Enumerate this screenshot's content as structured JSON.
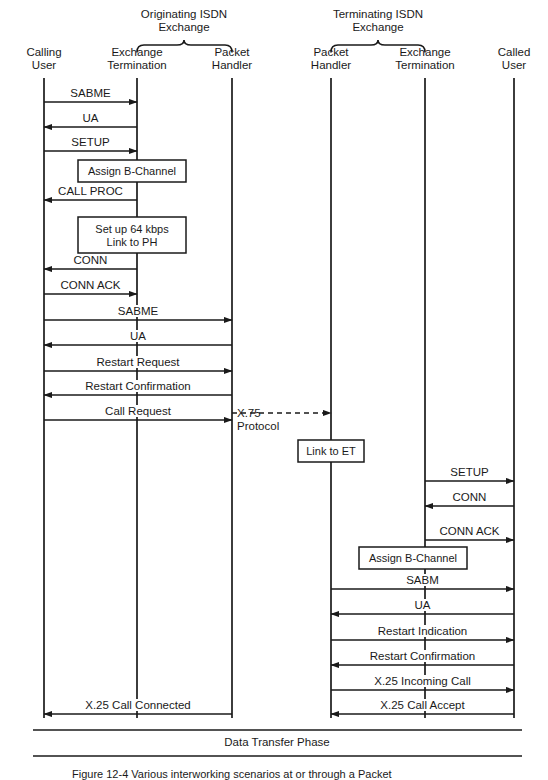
{
  "figure": {
    "caption": "Figure 12-4   Various interworking scenarios at or through a Packet",
    "phase_bar_label": "Data Transfer Phase"
  },
  "groups": [
    {
      "name": "originating-exchange",
      "line1": "Originating ISDN",
      "line2": "Exchange",
      "cx": 184,
      "left": 137,
      "right": 232
    },
    {
      "name": "terminating-exchange",
      "line1": "Terminating ISDN",
      "line2": "Exchange",
      "cx": 378,
      "left": 331,
      "right": 425
    }
  ],
  "lifelines": [
    {
      "name": "calling-user",
      "line1": "Calling",
      "line2": "User",
      "x": 44,
      "top": 78,
      "bottom": 718
    },
    {
      "name": "originating-exchange-termination",
      "line1": "Exchange",
      "line2": "Termination",
      "x": 137,
      "top": 78,
      "bottom": 718
    },
    {
      "name": "originating-packet-handler",
      "line1": "Packet",
      "line2": "Handler",
      "x": 232,
      "top": 78,
      "bottom": 718
    },
    {
      "name": "terminating-packet-handler",
      "line1": "Packet",
      "line2": "Handler",
      "x": 331,
      "top": 78,
      "bottom": 718
    },
    {
      "name": "terminating-exchange-termination",
      "line1": "Exchange",
      "line2": "Termination",
      "x": 425,
      "top": 78,
      "bottom": 718
    },
    {
      "name": "called-user",
      "line1": "Called",
      "line2": "User",
      "x": 514,
      "top": 78,
      "bottom": 718
    }
  ],
  "messages": [
    {
      "id": "m01",
      "label": "SABME",
      "from": 44,
      "to": 137,
      "y": 102,
      "dir": "right",
      "style": "solid"
    },
    {
      "id": "m02",
      "label": "UA",
      "from": 137,
      "to": 44,
      "y": 127,
      "dir": "left",
      "style": "solid"
    },
    {
      "id": "m03",
      "label": "SETUP",
      "from": 44,
      "to": 137,
      "y": 151,
      "dir": "right",
      "style": "solid"
    },
    {
      "id": "m04",
      "label": "CALL PROC",
      "from": 137,
      "to": 44,
      "y": 200,
      "dir": "left",
      "style": "solid"
    },
    {
      "id": "m05",
      "label": "CONN",
      "from": 137,
      "to": 44,
      "y": 269,
      "dir": "left",
      "style": "solid"
    },
    {
      "id": "m06",
      "label": "CONN ACK",
      "from": 44,
      "to": 137,
      "y": 294,
      "dir": "right",
      "style": "solid"
    },
    {
      "id": "m07",
      "label": "SABME",
      "from": 44,
      "to": 232,
      "y": 320,
      "dir": "right",
      "style": "solid"
    },
    {
      "id": "m08",
      "label": "UA",
      "from": 232,
      "to": 44,
      "y": 345,
      "dir": "left",
      "style": "solid"
    },
    {
      "id": "m09",
      "label": "Restart Request",
      "from": 44,
      "to": 232,
      "y": 371,
      "dir": "right",
      "style": "solid"
    },
    {
      "id": "m10",
      "label": "Restart Confirmation",
      "from": 232,
      "to": 44,
      "y": 395,
      "dir": "left",
      "style": "solid"
    },
    {
      "id": "m11",
      "label": "Call Request",
      "from": 44,
      "to": 232,
      "y": 420,
      "dir": "right",
      "style": "solid"
    },
    {
      "id": "m12",
      "label": "",
      "from": 232,
      "to": 331,
      "y": 413,
      "dir": "right",
      "style": "dashed"
    },
    {
      "id": "m13",
      "label": "SETUP",
      "from": 425,
      "to": 514,
      "y": 481,
      "dir": "right",
      "style": "solid"
    },
    {
      "id": "m14",
      "label": "CONN",
      "from": 514,
      "to": 425,
      "y": 506,
      "dir": "left",
      "style": "solid"
    },
    {
      "id": "m15",
      "label": "CONN ACK",
      "from": 425,
      "to": 514,
      "y": 540,
      "dir": "right",
      "style": "solid"
    },
    {
      "id": "m16",
      "label": "SABM",
      "from": 331,
      "to": 514,
      "y": 589,
      "dir": "right",
      "style": "solid"
    },
    {
      "id": "m17",
      "label": "UA",
      "from": 514,
      "to": 331,
      "y": 614,
      "dir": "left",
      "style": "solid"
    },
    {
      "id": "m18",
      "label": "Restart Indication",
      "from": 331,
      "to": 514,
      "y": 640,
      "dir": "right",
      "style": "solid"
    },
    {
      "id": "m19",
      "label": "Restart Confirmation",
      "from": 514,
      "to": 331,
      "y": 665,
      "dir": "left",
      "style": "solid"
    },
    {
      "id": "m20",
      "label": "X.25 Incoming Call",
      "from": 331,
      "to": 514,
      "y": 690,
      "dir": "right",
      "style": "solid"
    },
    {
      "id": "m21",
      "label": "X.25 Call Accept",
      "from": 514,
      "to": 331,
      "y": 714,
      "dir": "left",
      "style": "solid"
    },
    {
      "id": "m22",
      "label": "X.25 Call Connected",
      "from": 232,
      "to": 44,
      "y": 714,
      "dir": "left",
      "style": "solid"
    }
  ],
  "x75": {
    "line1": "X.75",
    "line2": "Protocol",
    "x": 237,
    "y": 407
  },
  "action_boxes": [
    {
      "name": "assign-b-channel-originating",
      "label_line1": "Assign B-Channel",
      "label_line2": "",
      "cx": 132,
      "cy": 171,
      "w": 108,
      "h": 22
    },
    {
      "name": "setup-64kbps-link-to-ph",
      "label_line1": "Set up 64 kbps",
      "label_line2": "Link to PH",
      "cx": 132,
      "cy": 235,
      "w": 108,
      "h": 36
    },
    {
      "name": "link-to-et",
      "label_line1": "Link to ET",
      "label_line2": "",
      "cx": 331,
      "cy": 451,
      "w": 66,
      "h": 22
    },
    {
      "name": "assign-b-channel-terminating",
      "label_line1": "Assign B-Channel",
      "label_line2": "",
      "cx": 413,
      "cy": 558,
      "w": 108,
      "h": 22
    }
  ],
  "phase_bar": {
    "x1": 33,
    "x2": 522,
    "y_top": 730,
    "y_bottom": 756,
    "label_cx": 277,
    "label_y": 736
  },
  "colors": {
    "ink": "#1a1a1a",
    "background": "#ffffff"
  }
}
